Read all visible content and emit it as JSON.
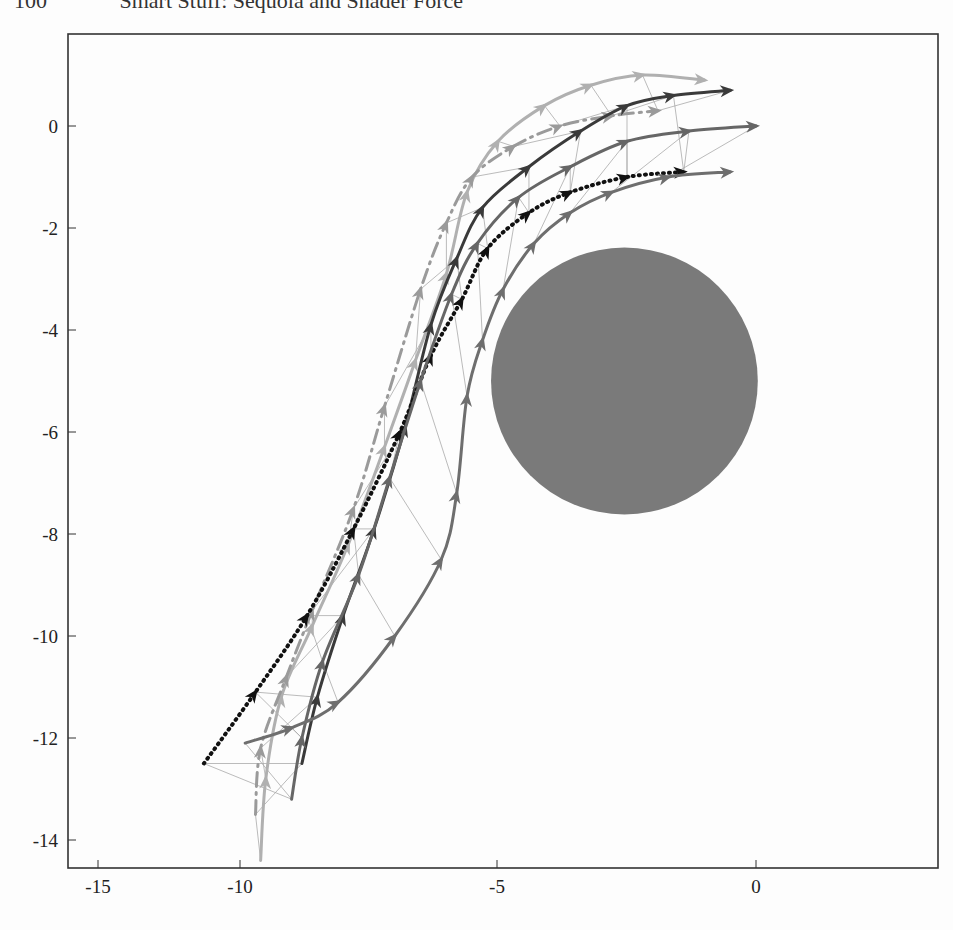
{
  "header": {
    "page_number": "100",
    "running_title": "Smart Stuff: Sequoia and Shader Force"
  },
  "chart_data": {
    "type": "line",
    "title": "",
    "xlabel": "",
    "ylabel": "",
    "xlim": [
      -13.4,
      3.5
    ],
    "ylim": [
      -14.6,
      1.8
    ],
    "grid": false,
    "legend": null,
    "x_ticks": [
      {
        "label": "-15",
        "px": 98
      },
      {
        "label": "-10",
        "px": 240
      },
      {
        "label": "-5",
        "px": 497
      },
      {
        "label": "0",
        "px": 756
      }
    ],
    "y_ticks": [
      {
        "label": "0",
        "value": 0
      },
      {
        "label": "-2",
        "value": -2
      },
      {
        "label": "-4",
        "value": -4
      },
      {
        "label": "-6",
        "value": -6
      },
      {
        "label": "-8",
        "value": -8
      },
      {
        "label": "-10",
        "value": -10
      },
      {
        "label": "-12",
        "value": -12
      },
      {
        "label": "-14",
        "value": -14
      }
    ],
    "obstacle": {
      "shape": "circle",
      "cx": -2.55,
      "cy": -5.0,
      "r": 2.6,
      "color": "#7a7a7a"
    },
    "series": [
      {
        "name": "agent-1-light",
        "style": "solid",
        "color": "#b0b0b0",
        "width": 3,
        "points": [
          [
            -9.6,
            -14.4
          ],
          [
            -9.5,
            -12.8
          ],
          [
            -9.2,
            -11.2
          ],
          [
            -8.6,
            -9.8
          ],
          [
            -7.9,
            -8.2
          ],
          [
            -7.2,
            -6.3
          ],
          [
            -6.6,
            -4.6
          ],
          [
            -6.0,
            -2.9
          ],
          [
            -5.6,
            -1.3
          ],
          [
            -5.0,
            -0.3
          ],
          [
            -4.1,
            0.4
          ],
          [
            -3.2,
            0.8
          ],
          [
            -2.2,
            1.0
          ],
          [
            -1.0,
            0.9
          ]
        ]
      },
      {
        "name": "agent-2-dashdot",
        "style": "dashdot",
        "color": "#9a9a9a",
        "width": 3,
        "points": [
          [
            -9.7,
            -13.5
          ],
          [
            -9.6,
            -12.2
          ],
          [
            -9.1,
            -10.8
          ],
          [
            -8.6,
            -9.5
          ],
          [
            -7.8,
            -7.5
          ],
          [
            -7.2,
            -5.5
          ],
          [
            -6.5,
            -3.2
          ],
          [
            -6.0,
            -1.9
          ],
          [
            -5.5,
            -1.0
          ],
          [
            -4.7,
            -0.4
          ],
          [
            -3.8,
            0.0
          ],
          [
            -2.8,
            0.2
          ],
          [
            -1.9,
            0.3
          ]
        ]
      },
      {
        "name": "agent-3-dark",
        "style": "solid",
        "color": "#3a3a3a",
        "width": 3,
        "points": [
          [
            -8.8,
            -12.5
          ],
          [
            -8.5,
            -11.2
          ],
          [
            -8.0,
            -9.6
          ],
          [
            -7.4,
            -7.9
          ],
          [
            -6.8,
            -5.9
          ],
          [
            -6.3,
            -3.9
          ],
          [
            -5.8,
            -2.6
          ],
          [
            -5.3,
            -1.6
          ],
          [
            -4.4,
            -0.8
          ],
          [
            -3.4,
            -0.1
          ],
          [
            -2.5,
            0.4
          ],
          [
            -1.6,
            0.6
          ],
          [
            -0.5,
            0.7
          ]
        ]
      },
      {
        "name": "agent-4-dotted",
        "style": "dotted",
        "color": "#111111",
        "width": 4,
        "points": [
          [
            -10.7,
            -12.5
          ],
          [
            -9.7,
            -11.1
          ],
          [
            -8.7,
            -9.6
          ],
          [
            -7.8,
            -7.9
          ],
          [
            -6.9,
            -6.0
          ],
          [
            -6.3,
            -4.5
          ],
          [
            -5.7,
            -3.4
          ],
          [
            -5.2,
            -2.4
          ],
          [
            -4.4,
            -1.7
          ],
          [
            -3.6,
            -1.3
          ],
          [
            -2.5,
            -1.0
          ],
          [
            -1.4,
            -0.9
          ]
        ]
      },
      {
        "name": "agent-5-mid",
        "style": "solid",
        "color": "#666666",
        "width": 3,
        "points": [
          [
            -9.0,
            -13.2
          ],
          [
            -8.8,
            -12.0
          ],
          [
            -8.4,
            -10.5
          ],
          [
            -7.7,
            -8.8
          ],
          [
            -7.1,
            -6.9
          ],
          [
            -6.5,
            -5.0
          ],
          [
            -5.9,
            -3.3
          ],
          [
            -5.4,
            -2.3
          ],
          [
            -4.6,
            -1.4
          ],
          [
            -3.6,
            -0.8
          ],
          [
            -2.5,
            -0.3
          ],
          [
            -1.3,
            -0.1
          ],
          [
            0.0,
            0.0
          ]
        ]
      },
      {
        "name": "agent-6-mid2",
        "style": "solid",
        "color": "#6e6e6e",
        "width": 3,
        "points": [
          [
            -9.9,
            -12.1
          ],
          [
            -9.0,
            -11.8
          ],
          [
            -8.1,
            -11.3
          ],
          [
            -7.0,
            -10.0
          ],
          [
            -6.1,
            -8.5
          ],
          [
            -5.8,
            -7.2
          ],
          [
            -5.6,
            -5.3
          ],
          [
            -5.3,
            -4.2
          ],
          [
            -4.9,
            -3.2
          ],
          [
            -4.3,
            -2.3
          ],
          [
            -3.6,
            -1.7
          ],
          [
            -2.8,
            -1.3
          ],
          [
            -1.7,
            -1.0
          ],
          [
            -0.5,
            -0.9
          ]
        ]
      }
    ]
  }
}
